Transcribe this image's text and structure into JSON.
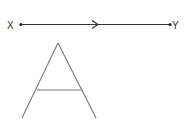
{
  "diagram": {
    "segment": {
      "start_label": "X",
      "end_label": "Y",
      "direction": "X to Y",
      "line_color": "#333333"
    },
    "figure": {
      "shape": "letter-A",
      "stroke_color": "#777777"
    }
  }
}
